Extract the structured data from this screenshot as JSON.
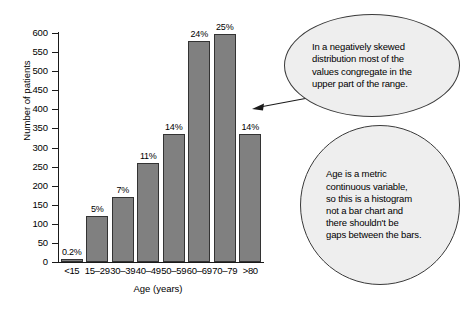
{
  "chart_data": {
    "type": "bar",
    "title": "",
    "xlabel": "Age (years)",
    "ylabel": "Number of patients",
    "categories": [
      "<15",
      "15–29",
      "30–39",
      "40–49",
      "50–59",
      "60–69",
      "70–79",
      ">80"
    ],
    "values": [
      5,
      120,
      170,
      260,
      335,
      578,
      597,
      335
    ],
    "data_labels": [
      "0.2%",
      "5%",
      "7%",
      "11%",
      "14%",
      "24%",
      "25%",
      "14%"
    ],
    "ylim": [
      0,
      600
    ],
    "yticks": [
      0,
      50,
      100,
      150,
      200,
      250,
      300,
      350,
      400,
      450,
      500,
      550,
      600
    ],
    "ytick_labels": [
      "0",
      "50",
      "100",
      "150",
      "200",
      "250",
      "300",
      "350",
      "400",
      "450",
      "500",
      "550",
      "600"
    ],
    "grid": false,
    "legend": "none",
    "bar_color": "#808080",
    "bar_edge_color": "#333333",
    "annotations": [
      {
        "name": "negative-skew-note",
        "text": "In a negatively skewed\ndistribution most of the\nvalues congregate in the\nupper part of the range.",
        "has_arrow": true
      },
      {
        "name": "histogram-note",
        "text": "Age is a metric\ncontinuous variable,\nso this is a histogram\nnot a bar chart and\nthere shouldn't be\ngaps between the bars.",
        "has_arrow": false
      }
    ]
  },
  "colors": {
    "background": "#ffffff",
    "axis": "#1a1a1a",
    "bubble_fill": "#eeeeee",
    "bubble_border": "#3a3a3a",
    "text": "#000000"
  }
}
